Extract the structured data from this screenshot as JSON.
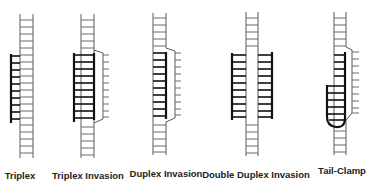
{
  "figure": {
    "panels": [
      {
        "id": "triplex",
        "label": "Triplex",
        "label_x": 20,
        "label_y": 170
      },
      {
        "id": "triplex-invasion",
        "label": "Triplex Invasion",
        "label_x": 88,
        "label_y": 170
      },
      {
        "id": "duplex-invasion",
        "label": "Duplex Invasion",
        "label_x": 166,
        "label_y": 168
      },
      {
        "id": "double-duplex-invasion",
        "label": "Double Duplex Invasion",
        "label_x": 256,
        "label_y": 169
      },
      {
        "id": "tail-clamp",
        "label": "Tail-Clamp",
        "label_x": 342,
        "label_y": 165
      }
    ],
    "colors": {
      "strand": "#111111",
      "duplex": "#5a5a5a",
      "background": "#ffffff"
    }
  }
}
